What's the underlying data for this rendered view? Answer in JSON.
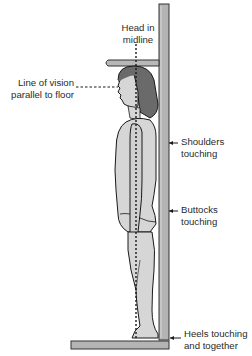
{
  "diagram": {
    "labels": {
      "head": "Head in\nmidline",
      "vision": "Line of vision\nparallel to floor",
      "shoulders": "Shoulders\ntouching",
      "buttocks": "Buttocks\ntouching",
      "heels": "Heels touching\nand together"
    },
    "colors": {
      "board": "#b4b4b4",
      "board_outline": "#333333",
      "skin": "#d6d6d6",
      "hair": "#6a6a6a",
      "outline": "#1a1a1a",
      "text": "#2a2a2a"
    }
  }
}
